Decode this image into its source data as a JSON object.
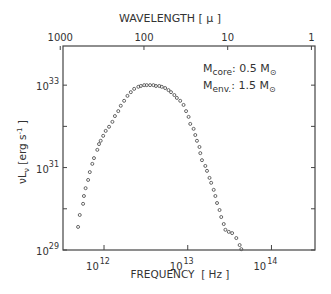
{
  "chart_data": {
    "type": "scatter",
    "title": "",
    "xlabel": "FREQUENCY  [ Hz ]",
    "ylabel": "νL_ν  [erg s⁻¹]",
    "top_xlabel": "WAVELENGTH  [ μ ]",
    "x_scale": "log",
    "y_scale": "log",
    "xlim_log10": [
      11.51,
      14.52
    ],
    "ylim_log10": [
      29,
      33.95
    ],
    "x_ticks": [
      {
        "log": 12,
        "base": "10",
        "exp": "12"
      },
      {
        "log": 13,
        "base": "10",
        "exp": "13"
      },
      {
        "log": 14,
        "base": "10",
        "exp": "14"
      }
    ],
    "y_ticks": [
      {
        "log": 29,
        "base": "10",
        "exp": "29",
        "labeled": true
      },
      {
        "log": 30,
        "labeled": false
      },
      {
        "log": 31,
        "base": "10",
        "exp": "31",
        "labeled": true
      },
      {
        "log": 32,
        "labeled": false
      },
      {
        "log": 33,
        "base": "10",
        "exp": "33",
        "labeled": true
      }
    ],
    "top_ticks": [
      {
        "label": "1000",
        "wavelength_micron": 1000
      },
      {
        "label": "100",
        "wavelength_micron": 100
      },
      {
        "label": "10",
        "wavelength_micron": 10
      },
      {
        "label": "1",
        "wavelength_micron": 1
      }
    ],
    "annotations": [
      {
        "prefix": "M",
        "sub": "core",
        "value": ": 0.5 M",
        "sun_sub": "⊙"
      },
      {
        "prefix": "M",
        "sub": "env.",
        "value": ": 1.5 M",
        "sun_sub": "⊙"
      }
    ],
    "grid": false,
    "legend": "none",
    "series": [
      {
        "name": "SED",
        "marker": "open-circle",
        "log10_nu": [
          11.69,
          11.71,
          11.75,
          11.76,
          11.78,
          11.81,
          11.83,
          11.86,
          11.88,
          11.92,
          11.94,
          11.96,
          11.99,
          12.02,
          12.06,
          12.1,
          12.13,
          12.17,
          12.2,
          12.24,
          12.28,
          12.32,
          12.36,
          12.41,
          12.44,
          12.48,
          12.51,
          12.55,
          12.59,
          12.62,
          12.66,
          12.69,
          12.73,
          12.77,
          12.8,
          12.84,
          12.87,
          12.91,
          12.95,
          12.98,
          13.01,
          13.03,
          13.07,
          13.09,
          13.11,
          13.14,
          13.15,
          13.17,
          13.21,
          13.23,
          13.26,
          13.28,
          13.31,
          13.33,
          13.35,
          13.38,
          13.4,
          13.43,
          13.45,
          13.49,
          13.53,
          13.58,
          13.62,
          13.64
        ],
        "log10_nuLnu": [
          29.56,
          29.85,
          30.12,
          30.31,
          30.5,
          30.7,
          30.89,
          31.09,
          31.23,
          31.43,
          31.57,
          31.65,
          31.77,
          31.89,
          31.99,
          32.11,
          32.25,
          32.37,
          32.5,
          32.62,
          32.74,
          32.83,
          32.91,
          32.96,
          32.98,
          33.0,
          33.0,
          33.0,
          33.0,
          32.98,
          32.98,
          32.96,
          32.93,
          32.88,
          32.83,
          32.76,
          32.69,
          32.62,
          32.52,
          32.37,
          32.23,
          32.06,
          31.94,
          31.79,
          31.65,
          31.5,
          31.35,
          31.18,
          31.04,
          30.92,
          30.75,
          30.63,
          30.46,
          30.31,
          30.14,
          29.97,
          29.8,
          29.63,
          29.49,
          29.44,
          29.41,
          29.29,
          29.12,
          29.02
        ]
      }
    ]
  }
}
